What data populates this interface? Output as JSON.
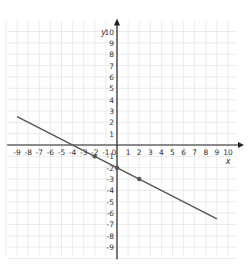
{
  "chart_data": {
    "type": "line",
    "title": "",
    "xlabel": "x",
    "ylabel": "y",
    "xlim": [
      -9,
      10
    ],
    "ylim": [
      -9,
      10
    ],
    "grid": true,
    "x_ticks": [
      -9,
      -8,
      -7,
      -6,
      -5,
      -4,
      -3,
      -2,
      -1,
      0,
      1,
      2,
      3,
      4,
      5,
      6,
      7,
      8,
      9,
      10
    ],
    "y_ticks": [
      -9,
      -8,
      -7,
      -6,
      -5,
      -4,
      -3,
      -2,
      -1,
      1,
      2,
      3,
      4,
      5,
      6,
      7,
      8,
      9,
      10
    ],
    "series": [
      {
        "name": "line",
        "equation": "y = -0.5x - 2",
        "x": [
          -9,
          9
        ],
        "y": [
          2.5,
          -6.5
        ],
        "color": "#555555"
      }
    ],
    "points": [
      {
        "x": -2,
        "y": -1
      },
      {
        "x": 0,
        "y": -2
      },
      {
        "x": 2,
        "y": -3
      }
    ],
    "colors": {
      "axis": "#222222",
      "grid": "#e6e6e6",
      "line": "#555555",
      "point": "#555555"
    }
  }
}
